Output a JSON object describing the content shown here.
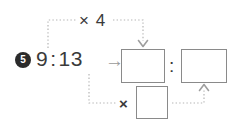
{
  "problem": {
    "number_badge": "5",
    "ratio_left": "9",
    "ratio_separator": ":",
    "ratio_right": "13",
    "transform_arrow": "→"
  },
  "operations": {
    "top_label": "× 4",
    "bottom_label": "×"
  },
  "answer_boxes": [
    {
      "name": "numerator-answer-box",
      "value": ""
    },
    {
      "name": "denominator-answer-box",
      "value": ""
    },
    {
      "name": "multiplier-answer-box",
      "value": ""
    }
  ],
  "result_separator": ":",
  "connectors": [
    {
      "name": "top-dotted-connector",
      "from": "ratio-left-term",
      "to": "numerator-answer-box",
      "style": "dotted",
      "arrowhead": "down"
    },
    {
      "name": "bottom-dotted-connector",
      "from": "ratio-right-term",
      "to": "multiplier-answer-box",
      "style": "dotted",
      "arrowhead": "none"
    },
    {
      "name": "right-dotted-connector",
      "from": "multiplier-answer-box",
      "to": "denominator-answer-box",
      "style": "dotted",
      "arrowhead": "up"
    }
  ],
  "colors": {
    "badge_fill": "#2b2b2b",
    "badge_text": "#ffffff",
    "text": "#3a3a3a",
    "box_border": "#8a8a8a",
    "connector": "#b0b0b0",
    "arrow_glyph": "#9a9a9a",
    "background": "#ffffff"
  }
}
